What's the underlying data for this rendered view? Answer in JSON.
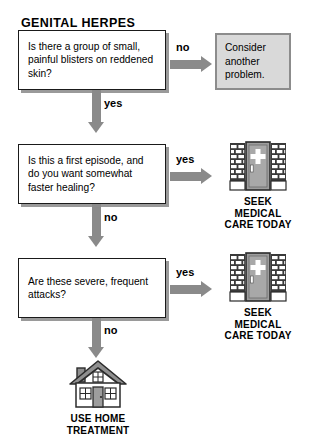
{
  "title": "GENITAL HERPES",
  "questions": [
    {
      "id": "q1",
      "text": "Is there a group of small, painful blisters on reddened skin?"
    },
    {
      "id": "q2",
      "text": "Is this a first episode, and do you want somewhat faster healing?"
    },
    {
      "id": "q3",
      "text": "Are these severe, frequent attacks?"
    }
  ],
  "branches": {
    "q1_no": "no",
    "q1_yes": "yes",
    "q2_yes": "yes",
    "q2_no": "no",
    "q3_yes": "yes",
    "q3_no": "no"
  },
  "outcomes": {
    "consider": "Consider another problem.",
    "seek_line1": "SEEK",
    "seek_line2": "MEDICAL",
    "seek_line3": "CARE TODAY",
    "home_line1": "USE HOME",
    "home_line2": "TREATMENT"
  },
  "icons": {
    "hospital": "hospital-icon",
    "house": "house-icon"
  },
  "colors": {
    "arrow_gray": "#8a8a8a",
    "box_border": "#1a1a1a",
    "box_shadow": "#9a9a9a",
    "terminal_fill": "#d9d9d9",
    "terminal_border": "#8c8c8c",
    "text": "#000000",
    "page_background": "#ffffff"
  }
}
